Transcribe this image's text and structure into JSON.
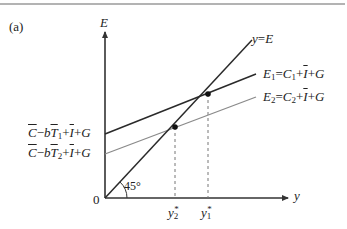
{
  "panel_label": "(a)",
  "axes": {
    "y_axis_label": "E",
    "x_axis_label": "y",
    "origin_label": "0"
  },
  "angle_label": "45°",
  "lines": {
    "forty_five": {
      "label_lhs": "y",
      "label_eq": "=",
      "label_rhs": "E"
    },
    "e1": {
      "name": "E",
      "sub": "1",
      "eq": "=",
      "c": "C",
      "c_sub": "1",
      "plus1": "+",
      "i": "I",
      "plus2": "+",
      "g": "G",
      "intercept_c": "C",
      "intercept_minus": "−",
      "intercept_b": "b",
      "intercept_t": "T",
      "intercept_t_sub": "1",
      "intercept_plus1": "+",
      "intercept_i": "I",
      "intercept_plus2": "+",
      "intercept_g": "G"
    },
    "e2": {
      "name": "E",
      "sub": "2",
      "eq": "=",
      "c": "C",
      "c_sub": "2",
      "plus1": "+",
      "i": "I",
      "plus2": "+",
      "g": "G",
      "intercept_c": "C",
      "intercept_minus": "−",
      "intercept_b": "b",
      "intercept_t": "T",
      "intercept_t_sub": "2",
      "intercept_plus1": "+",
      "intercept_i": "I",
      "intercept_plus2": "+",
      "intercept_g": "G"
    }
  },
  "equilibria": {
    "y1": {
      "base": "y",
      "sub": "1",
      "sup": "*"
    },
    "y2": {
      "base": "y",
      "sub": "2",
      "sup": "*"
    }
  },
  "colors": {
    "axis": "#333333",
    "e1_line": "#2a2a2a",
    "e2_line": "#8a8a8a",
    "forty_five_line": "#2a2a2a",
    "dashed": "#777777",
    "rule": "#9a9a9a"
  }
}
